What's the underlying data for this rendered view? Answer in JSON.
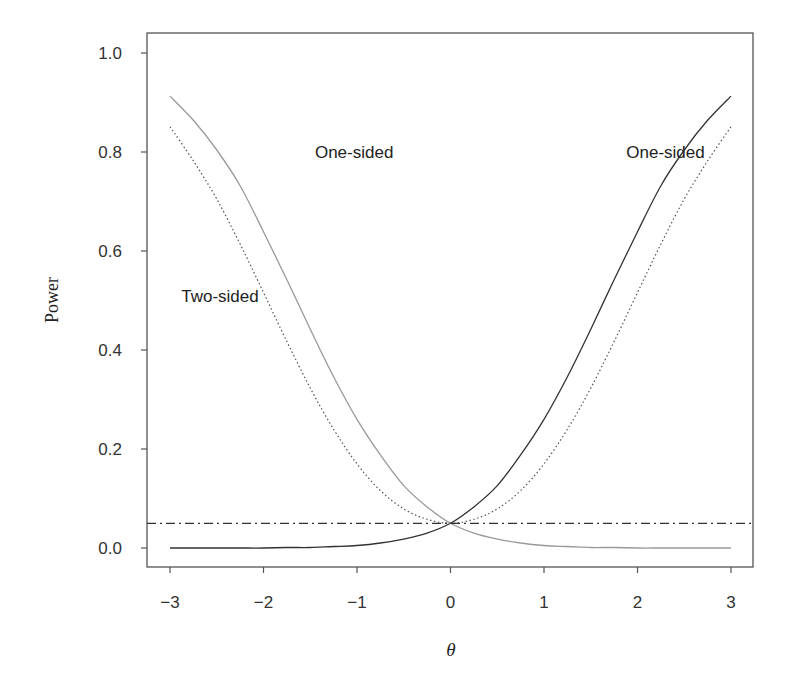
{
  "chart_data": {
    "type": "line",
    "title": "",
    "xlabel": "θ",
    "ylabel": "Power",
    "xlim": [
      -3,
      3
    ],
    "ylim": [
      0,
      1.0
    ],
    "grid": false,
    "legend": null,
    "x_ticks": [
      -3,
      -2,
      -1,
      0,
      1,
      2,
      3
    ],
    "x_tick_labels": [
      "−3",
      "−2",
      "−1",
      "0",
      "1",
      "2",
      "3"
    ],
    "y_ticks": [
      0.0,
      0.2,
      0.4,
      0.6,
      0.8,
      1.0
    ],
    "y_tick_labels": [
      "0.0",
      "0.2",
      "0.4",
      "0.6",
      "0.8",
      "1.0"
    ],
    "x": [
      -3.0,
      -2.75,
      -2.5,
      -2.25,
      -2.0,
      -1.75,
      -1.5,
      -1.25,
      -1.0,
      -0.75,
      -0.5,
      -0.25,
      0.0,
      0.25,
      0.5,
      0.75,
      1.0,
      1.25,
      1.5,
      1.75,
      2.0,
      2.25,
      2.5,
      2.75,
      3.0
    ],
    "series": [
      {
        "name": "One-sided (θ < 0 alternative)",
        "style": "solid",
        "color": "#9a9a9a",
        "values": [
          0.913,
          0.864,
          0.804,
          0.732,
          0.639,
          0.542,
          0.442,
          0.346,
          0.26,
          0.188,
          0.126,
          0.083,
          0.05,
          0.03,
          0.018,
          0.01,
          0.005,
          0.003,
          0.001,
          0.001,
          0.0,
          0.0,
          0.0,
          0.0,
          0.0
        ]
      },
      {
        "name": "One-sided (θ > 0 alternative)",
        "style": "solid",
        "color": "#333333",
        "values": [
          0.0,
          0.0,
          0.0,
          0.0,
          0.0,
          0.001,
          0.001,
          0.003,
          0.005,
          0.01,
          0.018,
          0.03,
          0.05,
          0.083,
          0.126,
          0.188,
          0.26,
          0.346,
          0.442,
          0.542,
          0.639,
          0.732,
          0.804,
          0.864,
          0.913
        ]
      },
      {
        "name": "Two-sided",
        "style": "dotted",
        "color": "#555555",
        "values": [
          0.851,
          0.782,
          0.705,
          0.614,
          0.516,
          0.417,
          0.323,
          0.24,
          0.17,
          0.116,
          0.079,
          0.058,
          0.05,
          0.058,
          0.079,
          0.116,
          0.17,
          0.24,
          0.323,
          0.417,
          0.516,
          0.614,
          0.705,
          0.782,
          0.851
        ]
      },
      {
        "name": "Significance level α",
        "style": "dashdot",
        "color": "#333333",
        "values": [
          0.05,
          0.05,
          0.05,
          0.05,
          0.05,
          0.05,
          0.05,
          0.05,
          0.05,
          0.05,
          0.05,
          0.05,
          0.05,
          0.05,
          0.05,
          0.05,
          0.05,
          0.05,
          0.05,
          0.05,
          0.05,
          0.05,
          0.05,
          0.05,
          0.05
        ]
      }
    ],
    "annotations": [
      {
        "text": "One-sided",
        "x": -1.45,
        "y": 0.8
      },
      {
        "text": "One-sided",
        "x": 1.88,
        "y": 0.8
      },
      {
        "text": "Two-sided",
        "x": -2.88,
        "y": 0.51
      }
    ]
  },
  "labels": {
    "y_axis": "Power",
    "x_axis": "θ"
  }
}
